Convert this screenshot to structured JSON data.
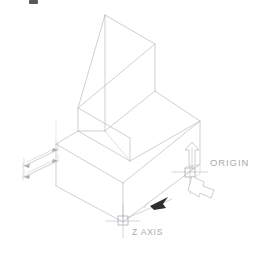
{
  "drawing": {
    "type": "isometric-technical-drawing",
    "title": "Isometric solid with origin and Z axis callouts",
    "background_color": "#ffffff",
    "line_color": "#b9bcc0",
    "text_color": "#a8abaf",
    "solid_arrow_color": "#2e2f31",
    "annotations": {
      "origin_label": "ORIGIN",
      "z_axis_label": "Z  AXIS"
    },
    "labels": [
      {
        "id": "origin",
        "text": "ORIGIN",
        "x": 210,
        "y": 166
      },
      {
        "id": "z-axis",
        "text": "Z  AXIS",
        "x": 132,
        "y": 234
      }
    ],
    "markers": [
      {
        "id": "origin-marker",
        "kind": "square-crosshair",
        "x": 190,
        "y": 174
      },
      {
        "id": "z-axis-marker",
        "kind": "square-crosshair",
        "x": 123,
        "y": 220
      }
    ],
    "arrows": [
      {
        "id": "origin-up-arrow",
        "kind": "hollow-3d",
        "direction": "up"
      },
      {
        "id": "origin-down-right-arrow",
        "kind": "hollow-3d",
        "direction": "down-right"
      },
      {
        "id": "z-axis-pointer",
        "kind": "solid-filled",
        "direction": "down-left"
      }
    ],
    "dimensions": {
      "count": 2,
      "side": "left",
      "style": "chained-isometric"
    }
  }
}
